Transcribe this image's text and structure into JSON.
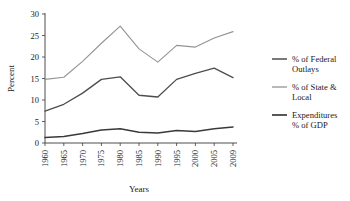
{
  "chart_data": {
    "type": "line",
    "title": "",
    "xlabel": "Years",
    "ylabel": "Percent",
    "x": [
      1960,
      1965,
      1970,
      1975,
      1980,
      1985,
      1990,
      1995,
      2000,
      2005,
      2009
    ],
    "xtick_labels": [
      "1960",
      "1965",
      "1970",
      "1975",
      "1980",
      "1985",
      "1990",
      "1995",
      "2000",
      "2005",
      "2009"
    ],
    "ytick_labels": [
      "0",
      "5",
      "10",
      "15",
      "20",
      "25",
      "30"
    ],
    "yticks": [
      0,
      5,
      10,
      15,
      20,
      25,
      30
    ],
    "ylim": [
      0,
      30
    ],
    "xlim": [
      1960,
      2009
    ],
    "grid": false,
    "legend_position": "right",
    "series": [
      {
        "name": "% of Federal Outlays",
        "legend_lines": [
          "% of Federal",
          "Outlays"
        ],
        "color": "#4d4d4d",
        "width": 1.3,
        "values": [
          7.4,
          9.0,
          11.6,
          14.8,
          15.4,
          11.1,
          10.7,
          14.8,
          16.2,
          17.4,
          15.2
        ]
      },
      {
        "name": "% of State & Local",
        "legend_lines": [
          "% of State &",
          "Local"
        ],
        "color": "#949494",
        "width": 1.1,
        "values": [
          14.8,
          15.3,
          19.0,
          23.2,
          27.2,
          21.9,
          18.8,
          22.7,
          22.3,
          24.4,
          25.9
        ]
      },
      {
        "name": "Expenditures % of GDP",
        "legend_lines": [
          "Expenditures",
          "% of GDP"
        ],
        "color": "#3a3a3a",
        "width": 1.5,
        "values": [
          1.3,
          1.5,
          2.2,
          3.0,
          3.3,
          2.5,
          2.3,
          2.9,
          2.7,
          3.3,
          3.7
        ]
      }
    ]
  }
}
